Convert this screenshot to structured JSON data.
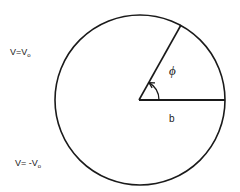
{
  "labels": {
    "upper_potential": {
      "main": "V=V",
      "sub": "o"
    },
    "lower_potential": {
      "main": "V= -V",
      "sub": "o"
    },
    "angle": "ϕ",
    "radius": "b"
  },
  "geometry_semantics": {
    "shape": "circle",
    "angle_deg": 60,
    "angle_arrow": "counterclockwise"
  },
  "colors": {
    "stroke": "#1a1a1a",
    "background": "#ffffff"
  }
}
